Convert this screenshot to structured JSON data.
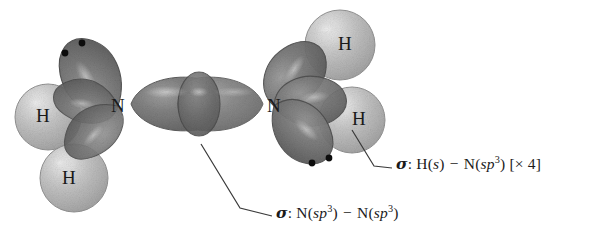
{
  "figure": {
    "molecule": "N2H4",
    "background_color": "#ffffff"
  },
  "palette": {
    "orbital_dark": "#6e6e6e",
    "orbital_dark_edge": "#4a4a4a",
    "orbital_highlight": "#c9c9c9",
    "hydrogen_sphere": "#b9b9b9",
    "hydrogen_sphere_edge": "#8e8e8e",
    "hydrogen_highlight": "#e2e2e2",
    "label_color": "#1a1a1a",
    "leader_line_color": "#3a3a3a",
    "lone_pair_dot": "#111111"
  },
  "atoms": {
    "nitrogen_left": {
      "label": "N",
      "x": 118,
      "y": 106
    },
    "nitrogen_right": {
      "label": "N",
      "x": 274,
      "y": 106
    },
    "hydrogens": [
      {
        "label": "H",
        "x": 42,
        "y": 116,
        "side": "left-upper"
      },
      {
        "label": "H",
        "x": 68,
        "y": 178,
        "side": "left-lower"
      },
      {
        "label": "H",
        "x": 344,
        "y": 44,
        "side": "right-upper"
      },
      {
        "label": "H",
        "x": 358,
        "y": 119,
        "side": "right-lower"
      }
    ]
  },
  "lone_pairs": [
    {
      "owner": "nitrogen_left",
      "dots": 2,
      "x": 74,
      "y": 46
    },
    {
      "owner": "nitrogen_right",
      "dots": 2,
      "x": 320,
      "y": 160
    }
  ],
  "captions": [
    {
      "id": "sigma-nn",
      "text": "σ: N(sp³) − N(sp³)",
      "sigma": "σ",
      "colon": ":",
      "left_atom": "N",
      "left_orbital": "sp",
      "left_superscript": "3",
      "minus": "−",
      "right_atom": "N",
      "right_orbital": "sp",
      "right_superscript": "3",
      "multiplicity": "",
      "x": 276,
      "y": 211
    },
    {
      "id": "sigma-hn",
      "text": "σ: H(s) − N(sp³) [× 4]",
      "sigma": "σ",
      "colon": ":",
      "left_atom": "H",
      "left_orbital": "s",
      "left_superscript": "",
      "minus": "−",
      "right_atom": "N",
      "right_orbital": "sp",
      "right_superscript": "3",
      "multiplicity": "[× 4]",
      "x": 396,
      "y": 162
    }
  ],
  "leader_lines": [
    {
      "id": "leader-sigma-nn",
      "from": "central N-N overlap region",
      "points": "201,144 240,208 272,216",
      "anchor_x": 201,
      "anchor_y": 144
    },
    {
      "id": "leader-sigma-hn",
      "from": "lower-right N-H overlap region",
      "points": "352,130 374,166 392,168",
      "anchor_x": 352,
      "anchor_y": 130
    }
  ],
  "orbitals": {
    "central_bond": {
      "name": "N-N sigma bond",
      "left_lobe_tip_x": 131,
      "right_lobe_tip_x": 263,
      "overlap_center_x": 199,
      "center_y": 104
    },
    "left_nitrogen_lobes": [
      "lone-pair-up",
      "bond-h-upper-left",
      "bond-h-lower-left",
      "bond-to-right-N"
    ],
    "right_nitrogen_lobes": [
      "bond-h-upper-right",
      "bond-h-lower-right",
      "lone-pair-down-right",
      "bond-to-left-N"
    ]
  }
}
